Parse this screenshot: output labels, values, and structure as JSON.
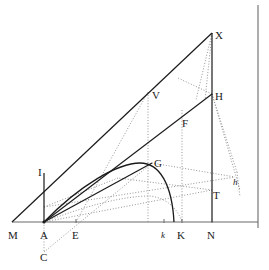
{
  "figure": {
    "type": "line-diagram",
    "width": 269,
    "height": 270,
    "background": "#ffffff",
    "stroke_solid": "#1a1a1a",
    "stroke_dotted": "#8a8a8a",
    "stroke_axis": "#6b6b6b"
  },
  "points": [
    {
      "id": "M",
      "label": "M",
      "x": 12,
      "y": 222,
      "label_x": 8,
      "label_y": 230,
      "style": "normal"
    },
    {
      "id": "A",
      "label": "A",
      "x": 44,
      "y": 222,
      "label_x": 40,
      "label_y": 230,
      "style": "normal"
    },
    {
      "id": "C",
      "label": "C",
      "x": 44,
      "y": 257,
      "label_x": 40,
      "label_y": 252,
      "style": "normal"
    },
    {
      "id": "E",
      "label": "E",
      "x": 76,
      "y": 222,
      "label_x": 72,
      "label_y": 230,
      "style": "normal"
    },
    {
      "id": "I",
      "label": "I",
      "x": 44,
      "y": 173,
      "label_x": 38,
      "label_y": 167,
      "style": "normal"
    },
    {
      "id": "G",
      "label": "G",
      "x": 152,
      "y": 163,
      "label_x": 154,
      "label_y": 158,
      "style": "normal"
    },
    {
      "id": "F",
      "label": "F",
      "x": 180,
      "y": 122,
      "label_x": 182,
      "label_y": 118,
      "style": "normal"
    },
    {
      "id": "V",
      "label": "V",
      "x": 148,
      "y": 92,
      "label_x": 152,
      "label_y": 90,
      "style": "normal"
    },
    {
      "id": "X",
      "label": "X",
      "x": 212,
      "y": 33,
      "label_x": 215,
      "label_y": 30,
      "style": "normal"
    },
    {
      "id": "H",
      "label": "H",
      "x": 212,
      "y": 94,
      "label_x": 215,
      "label_y": 91,
      "style": "normal"
    },
    {
      "id": "T",
      "label": "T",
      "x": 212,
      "y": 190,
      "label_x": 213,
      "label_y": 190,
      "style": "normal"
    },
    {
      "id": "N",
      "label": "N",
      "x": 212,
      "y": 222,
      "label_x": 207,
      "label_y": 230,
      "style": "normal"
    },
    {
      "id": "K",
      "label": "K",
      "x": 182,
      "y": 222,
      "label_x": 177,
      "label_y": 230,
      "style": "normal"
    },
    {
      "id": "k",
      "label": "k",
      "x": 164,
      "y": 222,
      "label_x": 161,
      "label_y": 230,
      "style": "italic-small"
    },
    {
      "id": "h",
      "label": "h",
      "x": 235,
      "y": 177,
      "label_x": 233,
      "label_y": 177,
      "style": "italic-small"
    }
  ],
  "solid_lines": [
    {
      "name": "baseline-M-N",
      "x1": 12,
      "y1": 222,
      "x2": 258,
      "y2": 222
    },
    {
      "name": "hypotenuse-M-X",
      "x1": 12,
      "y1": 222,
      "x2": 212,
      "y2": 33
    },
    {
      "name": "vertical-X-N",
      "x1": 212,
      "y1": 33,
      "x2": 212,
      "y2": 222
    },
    {
      "name": "vertical-I-A",
      "x1": 44,
      "y1": 173,
      "x2": 44,
      "y2": 222
    },
    {
      "name": "line-A-H",
      "x1": 44,
      "y1": 222,
      "x2": 212,
      "y2": 94
    },
    {
      "name": "line-A-G-edge",
      "x1": 44,
      "y1": 222,
      "x2": 152,
      "y2": 163
    },
    {
      "name": "right-border",
      "x1": 258,
      "y1": 5,
      "x2": 258,
      "y2": 228
    }
  ],
  "solid_curve": {
    "name": "arc-A-G-k",
    "path": "M 44 222 C 80 185, 118 163, 140 163 C 160 163, 172 185, 174 222"
  },
  "dotted_lines": [
    {
      "name": "dotted-A-C",
      "x1": 44,
      "y1": 222,
      "x2": 44,
      "y2": 252
    },
    {
      "name": "dotted-C-E-G",
      "x1": 44,
      "y1": 252,
      "x2": 152,
      "y2": 163
    },
    {
      "name": "dotted-E-up-V",
      "x1": 76,
      "y1": 222,
      "x2": 148,
      "y2": 92
    },
    {
      "name": "dotted-V-vertical",
      "x1": 148,
      "y1": 92,
      "x2": 148,
      "y2": 222
    },
    {
      "name": "dotted-F-vertical",
      "x1": 182,
      "y1": 110,
      "x2": 182,
      "y2": 222
    },
    {
      "name": "dotted-A-T",
      "x1": 44,
      "y1": 222,
      "x2": 212,
      "y2": 190
    },
    {
      "name": "dotted-A-h",
      "x1": 44,
      "y1": 207,
      "x2": 235,
      "y2": 177
    },
    {
      "name": "dotted-G-h",
      "x1": 152,
      "y1": 163,
      "x2": 235,
      "y2": 177
    },
    {
      "name": "dotted-H-h",
      "x1": 212,
      "y1": 94,
      "x2": 237,
      "y2": 172
    },
    {
      "name": "dotted-H-down-right",
      "x1": 212,
      "y1": 94,
      "x2": 240,
      "y2": 190
    },
    {
      "name": "dotted-h-down",
      "x1": 237,
      "y1": 172,
      "x2": 240,
      "y2": 197
    },
    {
      "name": "dotted-X-H-fan-a",
      "x1": 212,
      "y1": 33,
      "x2": 196,
      "y2": 100
    },
    {
      "name": "dotted-X-H-fan-b",
      "x1": 212,
      "y1": 33,
      "x2": 205,
      "y2": 100
    },
    {
      "name": "dotted-H-left",
      "x1": 212,
      "y1": 94,
      "x2": 178,
      "y2": 78
    },
    {
      "name": "dotted-T-left",
      "x1": 212,
      "y1": 190,
      "x2": 118,
      "y2": 178
    },
    {
      "name": "dotted-T-farleft",
      "x1": 118,
      "y1": 178,
      "x2": 44,
      "y2": 207
    }
  ],
  "dotted_curve": {
    "name": "arc-A-low-K",
    "path": "M 44 222 C 80 208, 120 196, 150 196 C 168 198, 178 210, 182 222"
  },
  "ticks": [
    {
      "name": "tick-A",
      "x": 44,
      "y": 222
    },
    {
      "name": "tick-E",
      "x": 76,
      "y": 222
    },
    {
      "name": "tick-k",
      "x": 164,
      "y": 222
    },
    {
      "name": "tick-K",
      "x": 182,
      "y": 222
    },
    {
      "name": "tick-N",
      "x": 212,
      "y": 222
    }
  ]
}
